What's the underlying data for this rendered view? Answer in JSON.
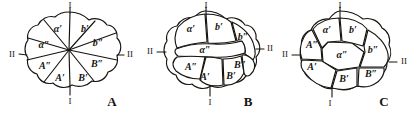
{
  "plate": {
    "caption_letters": [
      "A",
      "B",
      "C"
    ],
    "axis_marks": {
      "top": "I",
      "bottom": "I",
      "left": "II",
      "right": "II"
    }
  },
  "figures": [
    {
      "letter": "A",
      "description": "eight equal wedge sectors meeting at a central point",
      "segments": [
        {
          "id": "a-prime",
          "label": "α′",
          "position": "upper-left-inner"
        },
        {
          "id": "b-prime",
          "label": "b′",
          "position": "upper-right-inner"
        },
        {
          "id": "a-dprime",
          "label": "α″",
          "position": "left-upper"
        },
        {
          "id": "b-dprime",
          "label": "b″",
          "position": "right-upper"
        },
        {
          "id": "A-dprime",
          "label": "A″",
          "position": "left-lower"
        },
        {
          "id": "B-dprime",
          "label": "B″",
          "position": "right-lower"
        },
        {
          "id": "A-prime",
          "label": "A′",
          "position": "lower-left-inner"
        },
        {
          "id": "B-prime",
          "label": "B′",
          "position": "lower-right-inner"
        }
      ],
      "axis_labels": {
        "top": "I",
        "bottom": "I",
        "left": "II",
        "right": "II"
      }
    },
    {
      "letter": "B",
      "description": "eight cells around an enlarged central cell, central cell labelled alpha double prime",
      "segments": [
        {
          "id": "a-prime",
          "label": "α′",
          "position": "top-left"
        },
        {
          "id": "b-prime",
          "label": "b′",
          "position": "top-center"
        },
        {
          "id": "b-dprime",
          "label": "b″",
          "position": "top-right"
        },
        {
          "id": "a-dprime",
          "label": "α″",
          "position": "center"
        },
        {
          "id": "A-dprime",
          "label": "A″",
          "position": "left-lower"
        },
        {
          "id": "B-dprime",
          "label": "B″",
          "position": "right-lower"
        },
        {
          "id": "A-prime",
          "label": "A′",
          "position": "bottom-left"
        },
        {
          "id": "B-prime",
          "label": "B′",
          "position": "bottom-right"
        }
      ],
      "axis_labels": {
        "top": "I",
        "bottom": "I",
        "left": "II",
        "right": "II"
      }
    },
    {
      "letter": "C",
      "description": "eight cells surrounding a polygonal central cell labelled alpha double prime",
      "segments": [
        {
          "id": "a-prime",
          "label": "α′",
          "position": "top-left"
        },
        {
          "id": "b-prime",
          "label": "b′",
          "position": "top-right"
        },
        {
          "id": "A-dprime",
          "label": "A″",
          "position": "left-upper"
        },
        {
          "id": "a-dprime",
          "label": "α″",
          "position": "center"
        },
        {
          "id": "b-dprime",
          "label": "b″",
          "position": "right-upper"
        },
        {
          "id": "A-prime",
          "label": "A′",
          "position": "left-lower"
        },
        {
          "id": "B-prime",
          "label": "B′",
          "position": "bottom-center"
        },
        {
          "id": "B-dprime",
          "label": "B″",
          "position": "right-lower"
        }
      ],
      "axis_labels": {
        "top": "I",
        "bottom": "I",
        "left": "II",
        "right": "II"
      }
    }
  ],
  "colors": {
    "ink": "#17140f",
    "paper": "#ffffff"
  }
}
